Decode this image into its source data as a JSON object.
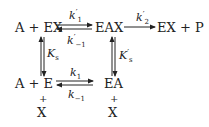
{
  "diagram": {
    "type": "reaction-scheme",
    "species": {
      "top_left": "A + EX",
      "top_middle": "EAX",
      "top_right": "EX + P",
      "bottom_left": "A + E",
      "bottom_middle": "EA",
      "plus": "+",
      "x": "X"
    },
    "rate_constants": {
      "k1p": {
        "sym": "k",
        "prime": "′",
        "sub": "1"
      },
      "km1p": {
        "sym": "k",
        "prime": "′",
        "sub": "−1"
      },
      "k2p": {
        "sym": "k",
        "prime": "′",
        "sub": "2"
      },
      "k1": {
        "sym": "k",
        "sub": "1"
      },
      "km1": {
        "sym": "k",
        "sub": "−1"
      },
      "Ks": {
        "sym": "K",
        "sub": "s"
      },
      "Ksp": {
        "sym": "K",
        "prime": "′",
        "sub": "s"
      }
    },
    "edges": [
      {
        "from": "A + EX",
        "to": "EAX",
        "type": "reversible",
        "forward": "k′1",
        "reverse": "k′−1"
      },
      {
        "from": "EAX",
        "to": "EX + P",
        "type": "irreversible",
        "label": "k′2"
      },
      {
        "from": "A + EX",
        "to": "A + E",
        "type": "equilibrium",
        "label": "Ks"
      },
      {
        "from": "EAX",
        "to": "EA",
        "type": "equilibrium",
        "label": "K′s"
      },
      {
        "from": "A + E",
        "to": "EA",
        "type": "reversible",
        "forward": "k1",
        "reverse": "k−1"
      }
    ]
  }
}
